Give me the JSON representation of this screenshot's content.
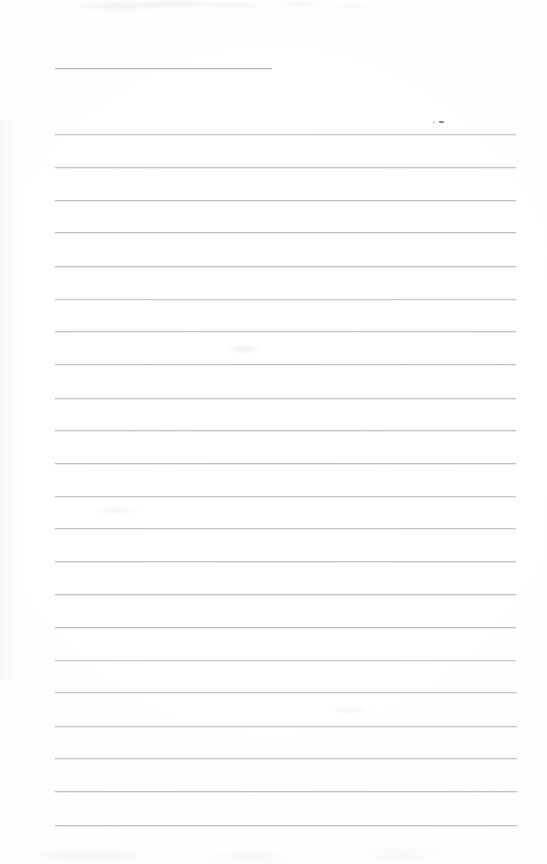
{
  "document": {
    "kind": "scanned-ruled-notepad-page",
    "title": "",
    "body_text": "",
    "page_width": 547,
    "page_height": 864,
    "background_color": "#fefefe",
    "rule_color": "#b9bcc2",
    "rule_thickness_px": 1,
    "rule_spacing_px": 32.7,
    "is_blank": true
  },
  "header_rule": {
    "name": "header-rule",
    "x_start": 55,
    "x_end": 272,
    "y": 68,
    "length": 217,
    "color": "#adb1b8"
  },
  "rules": [
    {
      "index": 1,
      "y": 134,
      "x_start": 55,
      "x_end": 516
    },
    {
      "index": 2,
      "y": 167,
      "x_start": 55,
      "x_end": 516
    },
    {
      "index": 3,
      "y": 200,
      "x_start": 55,
      "x_end": 516
    },
    {
      "index": 4,
      "y": 232,
      "x_start": 55,
      "x_end": 516
    },
    {
      "index": 5,
      "y": 266,
      "x_start": 55,
      "x_end": 516
    },
    {
      "index": 6,
      "y": 299,
      "x_start": 55,
      "x_end": 516
    },
    {
      "index": 7,
      "y": 331,
      "x_start": 55,
      "x_end": 516
    },
    {
      "index": 8,
      "y": 364,
      "x_start": 55,
      "x_end": 516
    },
    {
      "index": 9,
      "y": 398,
      "x_start": 55,
      "x_end": 516
    },
    {
      "index": 10,
      "y": 430,
      "x_start": 55,
      "x_end": 516
    },
    {
      "index": 11,
      "y": 463,
      "x_start": 55,
      "x_end": 516
    },
    {
      "index": 12,
      "y": 496,
      "x_start": 55,
      "x_end": 516
    },
    {
      "index": 13,
      "y": 528,
      "x_start": 55,
      "x_end": 516
    },
    {
      "index": 14,
      "y": 561,
      "x_start": 55,
      "x_end": 516
    },
    {
      "index": 15,
      "y": 594,
      "x_start": 55,
      "x_end": 516
    },
    {
      "index": 16,
      "y": 627,
      "x_start": 55,
      "x_end": 516
    },
    {
      "index": 17,
      "y": 660,
      "x_start": 55,
      "x_end": 516
    },
    {
      "index": 18,
      "y": 692,
      "x_start": 55,
      "x_end": 517
    },
    {
      "index": 19,
      "y": 726,
      "x_start": 55,
      "x_end": 517
    },
    {
      "index": 20,
      "y": 758,
      "x_start": 55,
      "x_end": 517
    },
    {
      "index": 21,
      "y": 791,
      "x_start": 55,
      "x_end": 517
    },
    {
      "index": 22,
      "y": 825,
      "x_start": 55,
      "x_end": 517
    }
  ],
  "marks": [
    {
      "name": "stray-pencil-mark",
      "x": 439,
      "y": 121,
      "width": 5,
      "height": 2,
      "color": "#6e7076"
    },
    {
      "name": "stray-pencil-dot",
      "x": 433,
      "y": 122,
      "width": 2,
      "height": 1,
      "color": "#9a9ca2"
    }
  ],
  "smudges": [
    {
      "x": 225,
      "y": 344,
      "w": 36,
      "h": 10,
      "color": "rgba(226,227,231,0.55)"
    },
    {
      "x": 95,
      "y": 505,
      "w": 44,
      "h": 11,
      "color": "rgba(232,233,237,0.45)"
    },
    {
      "x": 330,
      "y": 705,
      "w": 40,
      "h": 10,
      "color": "rgba(233,234,238,0.40)"
    }
  ]
}
